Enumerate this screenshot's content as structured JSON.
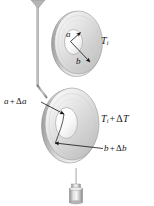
{
  "figure": {
    "background_color": "#ffffff",
    "width_px": 154,
    "height_px": 206,
    "colors": {
      "metal_light": "#f2f2f2",
      "metal_mid": "#d4d4d4",
      "metal_dark": "#a8a8a8",
      "outline": "#8c8c8c",
      "leader_line": "#111111",
      "text": "#16161a"
    }
  },
  "objects": {
    "hanging_wire": {
      "name": "suspension wire with conical tip",
      "tip_shape": "cone",
      "color": "#9a9a9a"
    },
    "washer_initial": {
      "name": "washer at initial temperature",
      "inner_radius_symbol": "a",
      "outer_radius_symbol": "b",
      "temperature_symbol": "Ti"
    },
    "washer_heated": {
      "name": "washer after heating",
      "inner_radius_symbol": "a + Δa",
      "outer_radius_symbol": "b + Δb",
      "temperature_symbol": "Ti + ΔT"
    },
    "bottom_probe": {
      "name": "cylindrical rod with collar",
      "color": "#bdbdbd"
    }
  },
  "labels": {
    "inner_radius": {
      "symbol": "a",
      "target": "inner edge of upper washer"
    },
    "outer_radius": {
      "symbol": "b",
      "target": "outer edge of upper washer"
    },
    "temperature_initial": {
      "symbol": "T",
      "subscript": "i",
      "full": "Ti"
    },
    "inner_radius_expanded": {
      "symbol": "a",
      "operator": "+",
      "delta": "Δ",
      "delta_symbol": "a",
      "full": "a + Δa"
    },
    "temperature_expanded": {
      "symbol": "T",
      "subscript": "i",
      "operator": "+",
      "delta": "Δ",
      "delta_symbol": "T",
      "full": "Ti + ΔT"
    },
    "outer_radius_expanded": {
      "symbol": "b",
      "operator": "+",
      "delta": "Δ",
      "delta_symbol": "b",
      "full": "b + Δb"
    }
  }
}
